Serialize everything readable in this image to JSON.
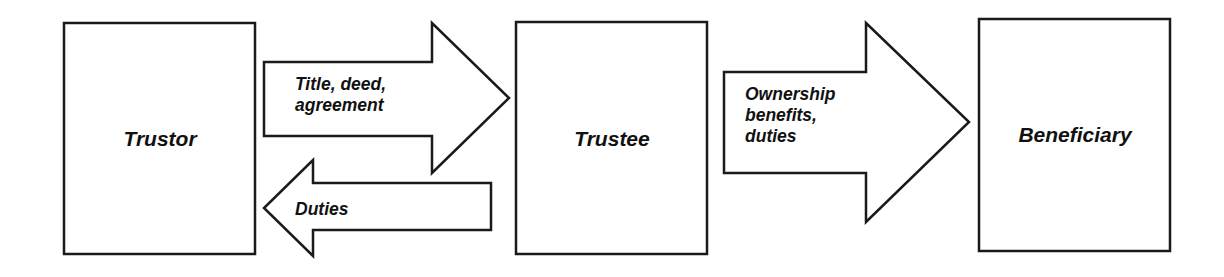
{
  "diagram": {
    "title": "",
    "colors": {
      "background": "#ffffff",
      "stroke": "#1a1a1a",
      "text": "#111111"
    },
    "nodes": [
      {
        "id": "trustor",
        "label": "Trustor"
      },
      {
        "id": "trustee",
        "label": "Trustee"
      },
      {
        "id": "beneficiary",
        "label": "Beneficiary"
      }
    ],
    "edges": [
      {
        "from": "trustor",
        "to": "trustee",
        "direction": "right",
        "label_lines": [
          "Title, deed,",
          "agreement"
        ]
      },
      {
        "from": "trustee",
        "to": "trustor",
        "direction": "left",
        "label_lines": [
          "Duties"
        ]
      },
      {
        "from": "trustee",
        "to": "beneficiary",
        "direction": "right",
        "label_lines": [
          "Ownership",
          "benefits,",
          "duties"
        ]
      }
    ]
  }
}
